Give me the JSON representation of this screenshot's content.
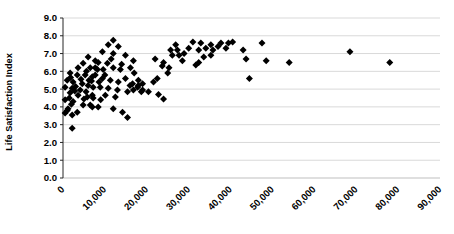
{
  "chart_data": {
    "type": "scatter",
    "title": "",
    "xlabel": "",
    "ylabel": "Life Satisfaction Index",
    "xlim": [
      0,
      90000
    ],
    "ylim": [
      0.0,
      9.0
    ],
    "x_tick_labels": [
      "0",
      "10,000",
      "20,000",
      "30,000",
      "40,000",
      "50,000",
      "60,000",
      "70,000",
      "80,000",
      "90,000"
    ],
    "y_tick_labels": [
      "0.0",
      "1.0",
      "2.0",
      "3.0",
      "4.0",
      "5.0",
      "6.0",
      "7.0",
      "8.0",
      "9.0"
    ],
    "grid": "horizontal",
    "legend": "none",
    "marker": {
      "shape": "diamond",
      "color": "#000000",
      "size": 7
    },
    "series": [
      {
        "name": "observations",
        "points": [
          [
            500,
            5.1
          ],
          [
            500,
            4.4
          ],
          [
            500,
            3.65
          ],
          [
            1000,
            5.5
          ],
          [
            1000,
            3.8
          ],
          [
            1200,
            3.9
          ],
          [
            1500,
            4.5
          ],
          [
            1700,
            5.9
          ],
          [
            1700,
            4.8
          ],
          [
            1800,
            5.65
          ],
          [
            2000,
            4.15
          ],
          [
            2200,
            5.05
          ],
          [
            2200,
            3.55
          ],
          [
            2200,
            2.8
          ],
          [
            2400,
            5.4
          ],
          [
            2400,
            4.3
          ],
          [
            2800,
            4.9
          ],
          [
            3000,
            5.15
          ],
          [
            3400,
            5.8
          ],
          [
            3400,
            3.7
          ],
          [
            3600,
            6.2
          ],
          [
            3600,
            4.65
          ],
          [
            4100,
            4.95
          ],
          [
            4300,
            5.55
          ],
          [
            4600,
            5.3
          ],
          [
            4800,
            6.45
          ],
          [
            4800,
            4.1
          ],
          [
            5000,
            4.45
          ],
          [
            5300,
            5.8
          ],
          [
            5500,
            4.85
          ],
          [
            5600,
            6.0
          ],
          [
            5800,
            4.55
          ],
          [
            6000,
            6.8
          ],
          [
            6000,
            5.2
          ],
          [
            6200,
            5.5
          ],
          [
            6500,
            6.2
          ],
          [
            6500,
            4.1
          ],
          [
            6800,
            5.45
          ],
          [
            7000,
            5.7
          ],
          [
            7000,
            4.65
          ],
          [
            7000,
            4.0
          ],
          [
            7200,
            5.1
          ],
          [
            7200,
            4.5
          ],
          [
            7700,
            6.6
          ],
          [
            7700,
            6.2
          ],
          [
            7700,
            5.8
          ],
          [
            8200,
            6.1
          ],
          [
            8400,
            6.5
          ],
          [
            8400,
            4.0
          ],
          [
            8600,
            5.4
          ],
          [
            8900,
            5.1
          ],
          [
            9000,
            4.4
          ],
          [
            9400,
            7.1
          ],
          [
            9400,
            5.6
          ],
          [
            9600,
            6.1
          ],
          [
            10000,
            5.8
          ],
          [
            10100,
            4.65
          ],
          [
            10600,
            6.45
          ],
          [
            10800,
            7.5
          ],
          [
            10800,
            5.05
          ],
          [
            11300,
            5.5
          ],
          [
            11500,
            6.7
          ],
          [
            12000,
            7.75
          ],
          [
            12000,
            7.0
          ],
          [
            12000,
            6.2
          ],
          [
            12000,
            3.9
          ],
          [
            12500,
            4.55
          ],
          [
            13000,
            4.95
          ],
          [
            13200,
            7.4
          ],
          [
            13200,
            5.4
          ],
          [
            13700,
            6.1
          ],
          [
            14000,
            6.4
          ],
          [
            14200,
            3.7
          ],
          [
            14900,
            6.9
          ],
          [
            14900,
            5.6
          ],
          [
            15400,
            4.85
          ],
          [
            15400,
            3.4
          ],
          [
            16000,
            5.2
          ],
          [
            16100,
            6.2
          ],
          [
            16600,
            5.3
          ],
          [
            16800,
            6.6
          ],
          [
            16800,
            4.95
          ],
          [
            17000,
            5.9
          ],
          [
            17800,
            5.1
          ],
          [
            18000,
            5.5
          ],
          [
            18000,
            5.2
          ],
          [
            18700,
            4.85
          ],
          [
            19000,
            5.3
          ],
          [
            19000,
            4.95
          ],
          [
            20400,
            4.85
          ],
          [
            21600,
            5.4
          ],
          [
            22000,
            6.7
          ],
          [
            22500,
            5.6
          ],
          [
            22800,
            4.7
          ],
          [
            23700,
            6.3
          ],
          [
            24000,
            6.5
          ],
          [
            24000,
            4.45
          ],
          [
            25000,
            5.9
          ],
          [
            25300,
            6.2
          ],
          [
            25700,
            7.2
          ],
          [
            26100,
            6.9
          ],
          [
            26900,
            7.5
          ],
          [
            27300,
            7.2
          ],
          [
            27700,
            6.9
          ],
          [
            28500,
            6.6
          ],
          [
            28900,
            7.0
          ],
          [
            30000,
            7.3
          ],
          [
            31000,
            7.65
          ],
          [
            31700,
            6.35
          ],
          [
            32400,
            7.2
          ],
          [
            32400,
            6.5
          ],
          [
            32900,
            7.6
          ],
          [
            33600,
            6.8
          ],
          [
            34100,
            7.3
          ],
          [
            35300,
            7.5
          ],
          [
            35300,
            6.9
          ],
          [
            35800,
            7.2
          ],
          [
            37000,
            7.4
          ],
          [
            37700,
            7.6
          ],
          [
            38900,
            7.3
          ],
          [
            39500,
            7.6
          ],
          [
            40500,
            7.65
          ],
          [
            43000,
            7.2
          ],
          [
            43700,
            6.7
          ],
          [
            44500,
            5.6
          ],
          [
            47500,
            7.6
          ],
          [
            48500,
            6.6
          ],
          [
            54000,
            6.5
          ],
          [
            68500,
            7.1
          ],
          [
            78000,
            6.5
          ]
        ]
      }
    ],
    "layout": {
      "plot_left": 63,
      "plot_right": 440,
      "plot_top": 18,
      "plot_bottom": 178,
      "x_label_rotation_deg": 45
    }
  },
  "colors": {
    "background": "#ffffff",
    "gridline": "#d9d9d9",
    "zero_line": "#bfbfbf",
    "axis_line": "#262626",
    "marker": "#000000",
    "text": "#000000"
  }
}
